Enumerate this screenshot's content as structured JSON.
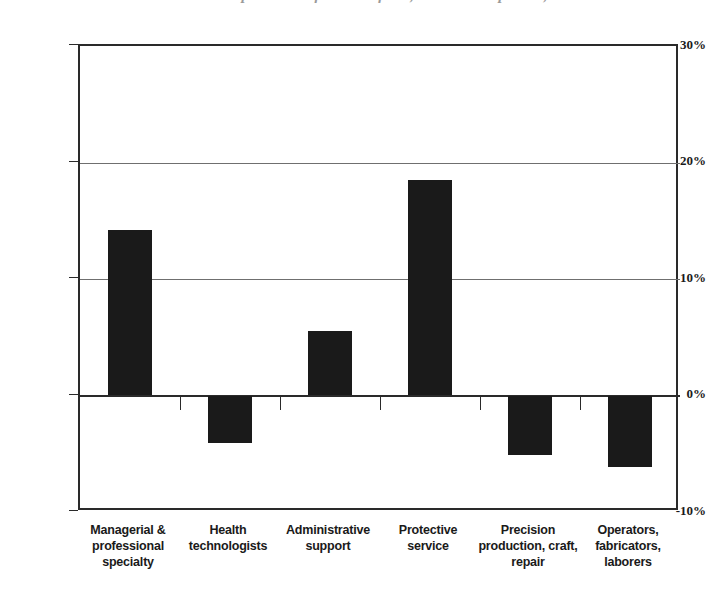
{
  "chart_data": {
    "type": "bar",
    "title": "Relative occupational shift in work force, selected occupations,",
    "subtitle": "",
    "xlabel": "",
    "ylabel": "",
    "categories": [
      "Managerial & professional specialty",
      "Health technologists",
      "Administrative support",
      "Protective service",
      "Precision production, craft, repair",
      "Operators, fabricators, laborers"
    ],
    "values": [
      14.2,
      -4.1,
      5.5,
      18.5,
      -5.1,
      -6.1
    ],
    "value_labels": [
      "14.2%",
      "−4.1%",
      "5.5%",
      "18.5%",
      "−5.1%",
      "−6.1%"
    ],
    "ylim": [
      -10,
      30
    ],
    "yticks": [
      30,
      20,
      10,
      0,
      -10
    ],
    "ytick_labels": [
      "30%",
      "20%",
      "10%",
      "0%",
      "-10%"
    ],
    "grid": true,
    "legend": "none",
    "bar_color": "#1a1a1a",
    "axis_color": "#2a2a2a",
    "grid_color": "#6f6f6f",
    "background": "#ffffff"
  },
  "category_lines": [
    [
      "Managerial &",
      "professional",
      "specialty"
    ],
    [
      "Health",
      "technologists"
    ],
    [
      "Administrative",
      "support"
    ],
    [
      "Protective service"
    ],
    [
      "Precision",
      "production, craft,",
      "repair"
    ],
    [
      "Operators,",
      "fabricators,",
      "laborers"
    ]
  ]
}
